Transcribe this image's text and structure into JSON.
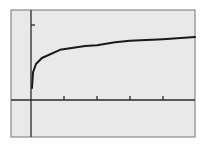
{
  "chart_data": {
    "type": "line",
    "title": "",
    "xlabel": "",
    "ylabel": "",
    "grid": false,
    "legend": null,
    "x_ticks": [
      1,
      2,
      3,
      4
    ],
    "y_ticks": [
      1
    ],
    "xlim": [
      -0.6,
      5.0
    ],
    "ylim": [
      -0.5,
      1.2
    ],
    "series": [
      {
        "name": "curve",
        "x": [
          0.03,
          0.06,
          0.15,
          0.33,
          0.88,
          1.64,
          2.0,
          2.55,
          3.0,
          4.0,
          4.97
        ],
        "y": [
          0.16,
          0.37,
          0.48,
          0.56,
          0.67,
          0.72,
          0.73,
          0.77,
          0.79,
          0.81,
          0.84
        ]
      }
    ]
  },
  "colors": {
    "page_background": "#ffffff",
    "plot_background": "#e9e9e9",
    "frame": "#8a8a8a",
    "axes": "#2a2a2a",
    "curve": "#1a1a1a"
  }
}
